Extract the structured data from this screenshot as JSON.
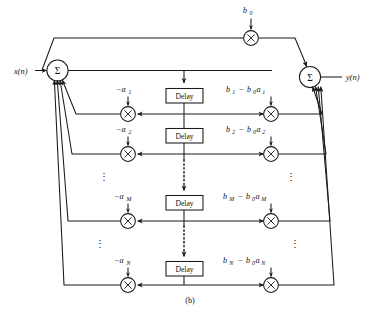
{
  "figure": {
    "caption": "(b)",
    "type": "signal-flow-graph"
  },
  "signals": {
    "input_label": "x(n)",
    "output_label": "y(n)"
  },
  "nodes": {
    "sum_left": "Σ",
    "sum_right": "Σ",
    "multiplier_glyph": "×",
    "delay_label": "Delay",
    "vertical_ellipsis": "⋮"
  },
  "top_path": {
    "gain_label": "b",
    "gain_sub": "0"
  },
  "rows": [
    {
      "index": 1,
      "left_coef_main": "−a",
      "left_coef_sub": "1",
      "right_coef_b": "b",
      "right_coef_b_sub": "1",
      "right_coef_op": "−",
      "right_coef_b0": "b",
      "right_coef_b0_sub": "0",
      "right_coef_a": "a",
      "right_coef_a_sub": "1",
      "delay_label": "Delay"
    },
    {
      "index": 2,
      "left_coef_main": "−a",
      "left_coef_sub": "2",
      "right_coef_b": "b",
      "right_coef_b_sub": "2",
      "right_coef_op": "−",
      "right_coef_b0": "b",
      "right_coef_b0_sub": "0",
      "right_coef_a": "a",
      "right_coef_a_sub": "2",
      "delay_label": "Delay"
    },
    {
      "index": 3,
      "left_coef_main": "−a",
      "left_coef_sub": "M",
      "right_coef_b": "b",
      "right_coef_b_sub": "M",
      "right_coef_op": "−",
      "right_coef_b0": "b",
      "right_coef_b0_sub": "0",
      "right_coef_a": "a",
      "right_coef_a_sub": "M",
      "delay_label": "Delay"
    },
    {
      "index": 4,
      "left_coef_main": "−a",
      "left_coef_sub": "N",
      "right_coef_b": "b",
      "right_coef_b_sub": "N",
      "right_coef_op": "−",
      "right_coef_b0": "b",
      "right_coef_b0_sub": "0",
      "right_coef_a": "a",
      "right_coef_a_sub": "N",
      "delay_label": "Delay"
    }
  ],
  "colors": {
    "ink": "#1a1a1a",
    "paper": "#ffffff"
  }
}
